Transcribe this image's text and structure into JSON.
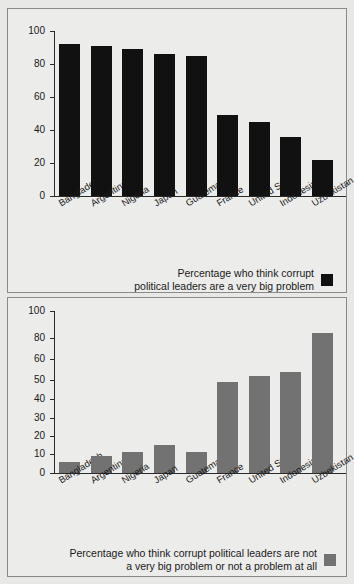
{
  "chart_data": [
    {
      "type": "bar",
      "id": "very-big-problem",
      "title": "",
      "xlabel": "",
      "ylabel": "",
      "ylim": [
        0,
        100
      ],
      "grid": false,
      "legend_position": "bottom-right",
      "series_color": "#111111",
      "legend": "Percentage who think corrupt\npolitical leaders are a very big problem",
      "yticks": [
        0,
        20,
        40,
        60,
        80,
        100
      ],
      "ytick_labels": [
        "0",
        "20",
        "40",
        "60",
        "80",
        "100"
      ],
      "categories": [
        "Bangladesh",
        "Argentina",
        "Nigeria",
        "Japan",
        "Guatemala",
        "France",
        "United States",
        "Indonesia",
        "Uzbekistan"
      ],
      "values": [
        92,
        91,
        89,
        86,
        85,
        49,
        45,
        36,
        22
      ]
    },
    {
      "type": "bar",
      "id": "not-a-very-big-problem",
      "title": "",
      "xlabel": "",
      "ylabel": "",
      "ylim": [
        0,
        100
      ],
      "grid": false,
      "legend_position": "bottom-right",
      "series_color": "#727272",
      "legend": "Percentage who think corrupt political leaders are not\na very big problem or not a problem at all",
      "yticks": [
        0,
        10,
        20,
        30,
        40,
        50,
        60,
        80,
        100
      ],
      "ytick_labels": [
        "0",
        "10",
        "20",
        "30",
        "40",
        "50",
        "60",
        "80",
        "100"
      ],
      "categories": [
        "Bangladesh",
        "Argentina",
        "Nigeria",
        "Japan",
        "Guatemala",
        "France",
        "United States",
        "Indonesia",
        "Uzbekistan"
      ],
      "values": [
        6,
        9,
        11,
        15,
        11,
        49,
        52,
        54,
        84
      ]
    }
  ],
  "colors": {
    "series_dark": "#111111",
    "series_grey": "#727272",
    "background": "#ececeb",
    "border": "#8a8a8a",
    "axis": "#2a2a2a"
  }
}
